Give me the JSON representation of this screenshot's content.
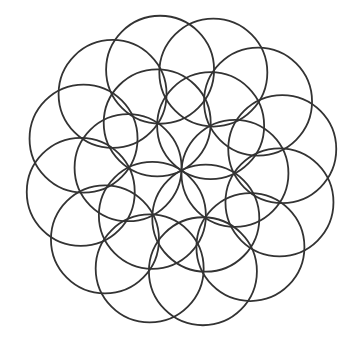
{
  "figure": {
    "width": 354,
    "height": 341,
    "background": "#ffffff",
    "stroke_color": "#333333",
    "stroke_width": 1.8,
    "center": {
      "x": 181.5,
      "y": 170.5
    },
    "rings": [
      {
        "name": "inner-ring",
        "count": 6,
        "circle_radius": 53.5,
        "center_distance": 53.5,
        "angle_offset_deg": 3
      },
      {
        "name": "outer-ring",
        "count": 12,
        "circle_radius": 54,
        "center_distance": 103,
        "angle_offset_deg": 18
      }
    ]
  }
}
